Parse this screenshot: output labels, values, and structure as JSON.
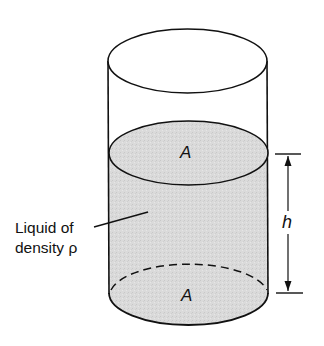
{
  "figure": {
    "type": "cylinder-liquid-column",
    "colors": {
      "stroke": "#111111",
      "liquid_fill": "#d9d9d9",
      "background": "#ffffff"
    },
    "labels": {
      "top_area": "A",
      "bottom_area": "A",
      "height": "h",
      "liquid_line1": "Liquid of",
      "liquid_line2": "density ρ"
    }
  }
}
